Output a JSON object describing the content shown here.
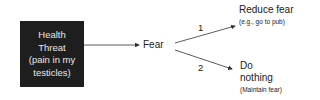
{
  "diagram": {
    "source": {
      "lines": [
        "Health",
        "Threat",
        "(pain in my",
        "testicles)"
      ]
    },
    "middle": "Fear",
    "branches": [
      {
        "number": "1",
        "title": "Reduce fear",
        "subtitle": "(e.g., go to pub)"
      },
      {
        "number": "2",
        "title_lines": [
          "Do",
          "nothing"
        ],
        "subtitle": "(Maintain fear)"
      }
    ],
    "colors": {
      "box_bg": "#1e1e1e",
      "box_text": "#e8e8e8",
      "line": "#333333"
    }
  }
}
